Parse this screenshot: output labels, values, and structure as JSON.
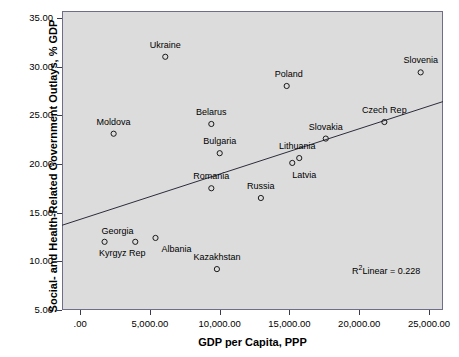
{
  "chart_data": {
    "type": "scatter",
    "title": "",
    "xlabel": "GDP per Capita, PPP",
    "ylabel": "Social- and Health-Related Government Outlays, % GDP",
    "xlim": [
      -1300,
      26000
    ],
    "ylim": [
      5.0,
      35.7
    ],
    "grid": false,
    "legend": "none",
    "xticks": [
      0,
      5000,
      10000,
      15000,
      20000,
      25000
    ],
    "xticklabels": [
      ".00",
      "5,000.00",
      "10,000.00",
      "15,000.00",
      "20,000.00",
      "25,000.00"
    ],
    "yticks": [
      5,
      10,
      15,
      20,
      25,
      30,
      35
    ],
    "yticklabels": [
      "5.00",
      "10.00",
      "15.00",
      "20.00",
      "25.00",
      "30.00",
      "35.00"
    ],
    "points": [
      {
        "name": "Ukraine",
        "x": 6100,
        "y": 31.0,
        "label_dx": 0,
        "label_dy": -11,
        "label_anchor": "middle"
      },
      {
        "name": "Slovenia",
        "x": 24400,
        "y": 29.4,
        "label_dx": 0,
        "label_dy": -11,
        "label_anchor": "middle"
      },
      {
        "name": "Poland",
        "x": 14800,
        "y": 28.0,
        "label_dx": 2,
        "label_dy": -11,
        "label_anchor": "middle"
      },
      {
        "name": "Belarus",
        "x": 9400,
        "y": 24.1,
        "label_dx": 0,
        "label_dy": -11,
        "label_anchor": "middle"
      },
      {
        "name": "Czech Rep",
        "x": 21800,
        "y": 24.3,
        "label_dx": 0,
        "label_dy": -11,
        "label_anchor": "middle"
      },
      {
        "name": "Moldova",
        "x": 2400,
        "y": 23.1,
        "label_dx": 0,
        "label_dy": -11,
        "label_anchor": "middle"
      },
      {
        "name": "Slovakia",
        "x": 17600,
        "y": 22.6,
        "label_dx": 0,
        "label_dy": -11,
        "label_anchor": "middle"
      },
      {
        "name": "Bulgaria",
        "x": 10000,
        "y": 21.1,
        "label_dx": 0,
        "label_dy": -11,
        "label_anchor": "middle"
      },
      {
        "name": "Lithuania",
        "x": 15700,
        "y": 20.6,
        "label_dx": -2,
        "label_dy": -11,
        "label_anchor": "middle"
      },
      {
        "name": "Latvia",
        "x": 15200,
        "y": 20.1,
        "label_dx": 12,
        "label_dy": 13,
        "label_anchor": "middle"
      },
      {
        "name": "Romania",
        "x": 9400,
        "y": 17.5,
        "label_dx": 0,
        "label_dy": -11,
        "label_anchor": "middle"
      },
      {
        "name": "Russia",
        "x": 12950,
        "y": 16.5,
        "label_dx": 0,
        "label_dy": -11,
        "label_anchor": "middle"
      },
      {
        "name": "Albania",
        "x": 5400,
        "y": 12.4,
        "label_dx": 21,
        "label_dy": 12,
        "label_anchor": "middle"
      },
      {
        "name": "Georgia",
        "x": 1750,
        "y": 12.0,
        "label_dx": 13,
        "label_dy": -10,
        "label_anchor": "middle"
      },
      {
        "name": "Kyrgyz Rep",
        "x": 3950,
        "y": 12.0,
        "label_dx": -13,
        "label_dy": 12,
        "label_anchor": "middle"
      },
      {
        "name": "Kazakhstan",
        "x": 9800,
        "y": 9.2,
        "label_dx": 0,
        "label_dy": -11,
        "label_anchor": "middle"
      }
    ],
    "fit_line": {
      "type": "linear",
      "x_start": -1300,
      "y_start": 13.7,
      "x_end": 26000,
      "y_end": 26.4
    },
    "annotation": {
      "prefix": "R",
      "exponent": "2",
      "suffix": "Linear = 0.228"
    }
  }
}
